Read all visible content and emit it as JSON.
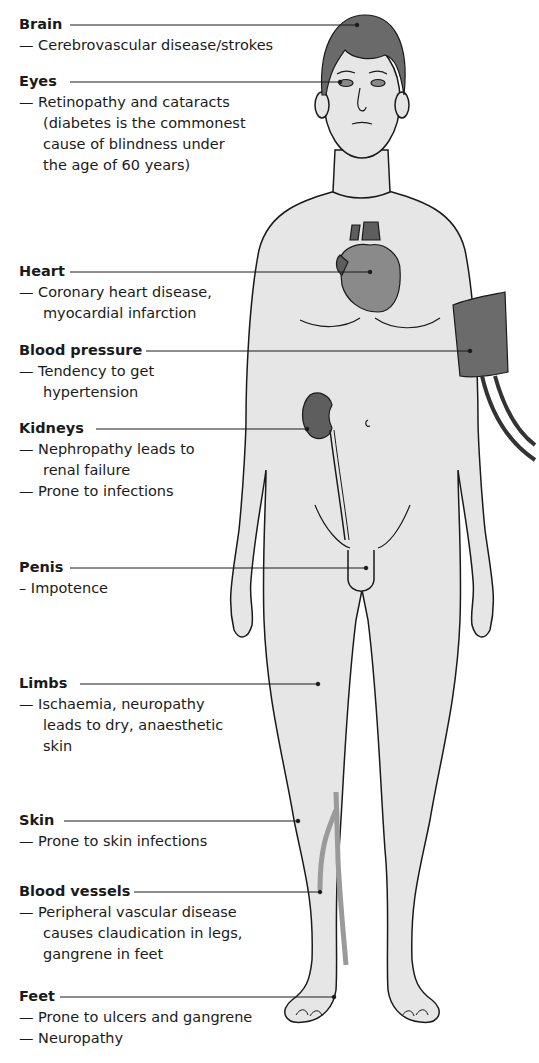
{
  "figure": {
    "colors": {
      "skin": "#e6e6e6",
      "outline": "#1a1a1a",
      "organ": "#8a8a8a",
      "organ_dark": "#5e5e5e",
      "cuff": "#6b6b6b",
      "vessel": "#9a9a9a",
      "hair": "#6a6a6a",
      "text": "#1a1a1a"
    }
  },
  "labels": [
    {
      "id": "brain",
      "title": "Brain",
      "lines": [
        "— Cerebrovascular disease/strokes"
      ]
    },
    {
      "id": "eyes",
      "title": "Eyes",
      "lines": [
        "— Retinopathy and cataracts",
        "(diabetes is the commonest",
        "cause of blindness under",
        "the age of 60 years)"
      ]
    },
    {
      "id": "heart",
      "title": "Heart",
      "lines": [
        "— Coronary heart disease,",
        "myocardial infarction"
      ]
    },
    {
      "id": "blood-pressure",
      "title": "Blood pressure",
      "lines": [
        "— Tendency to get",
        "hypertension"
      ]
    },
    {
      "id": "kidneys",
      "title": "Kidneys",
      "lines": [
        "— Nephropathy leads to",
        "renal failure",
        "— Prone to infections"
      ]
    },
    {
      "id": "penis",
      "title": "Penis",
      "lines": [
        "– Impotence"
      ]
    },
    {
      "id": "limbs",
      "title": "Limbs",
      "lines": [
        "— Ischaemia, neuropathy",
        "leads to dry, anaesthetic",
        "skin"
      ]
    },
    {
      "id": "skin",
      "title": "Skin",
      "lines": [
        "— Prone to skin infections"
      ]
    },
    {
      "id": "blood-vessels",
      "title": "Blood vessels",
      "lines": [
        "— Peripheral vascular disease",
        "causes claudication in legs,",
        "gangrene in feet"
      ]
    },
    {
      "id": "feet",
      "title": "Feet",
      "lines": [
        "— Prone to ulcers and gangrene",
        "— Neuropathy"
      ]
    }
  ]
}
